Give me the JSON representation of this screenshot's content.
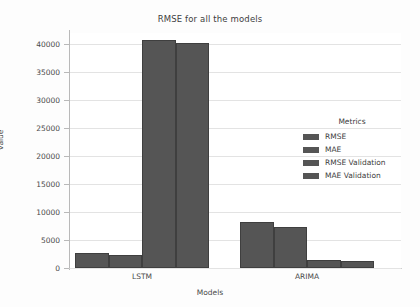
{
  "chart_data": {
    "type": "bar",
    "title": "RMSE for all the models",
    "xlabel": "Models",
    "ylabel": "value",
    "categories": [
      "LSTM",
      "ARIMA"
    ],
    "series": [
      {
        "name": "RMSE",
        "values": [
          2700,
          8200
        ]
      },
      {
        "name": "MAE",
        "values": [
          2300,
          7350
        ]
      },
      {
        "name": "RMSE Validation",
        "values": [
          40700,
          1500
        ]
      },
      {
        "name": "MAE Validation",
        "values": [
          40200,
          1300
        ]
      }
    ],
    "legend_title": "Metrics",
    "legend_position": "center-right",
    "ylim": [
      0,
      42000
    ],
    "yticks": [
      0,
      5000,
      10000,
      15000,
      20000,
      25000,
      30000,
      35000,
      40000
    ],
    "ytick_labels": [
      "0",
      "5000",
      "10000",
      "15000",
      "20000",
      "25000",
      "30000",
      "35000",
      "40000"
    ],
    "grid": true,
    "grid_axis": "y",
    "bar_color": "#555555",
    "background_color": "#ffffff"
  }
}
